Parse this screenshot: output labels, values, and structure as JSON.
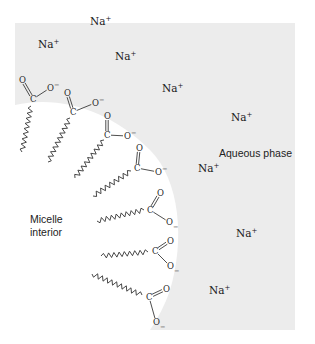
{
  "diagram": {
    "colors": {
      "aqueous_phase": "#ececec",
      "micelle_interior": "#ffffff",
      "ink": "#2a2a2a"
    },
    "region_labels": {
      "aqueous": "Aqueous phase",
      "micelle_line1": "Micelle",
      "micelle_line2": "interior"
    },
    "counterion": {
      "symbol": "Na",
      "charge": "+"
    },
    "counterion_count": 9,
    "headgroup": {
      "carbon": "C",
      "oxygen": "O",
      "anion_charge": "−"
    },
    "surfactant_count": 8
  }
}
